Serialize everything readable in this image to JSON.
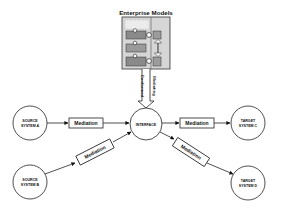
{
  "diagram": {
    "title": "Enterprise Models",
    "interface": {
      "label": "INTERFACE"
    },
    "vertical_link": {
      "left_label": "Conformed",
      "right_label": "Mediating"
    },
    "sources": [
      {
        "line1": "SOURCE",
        "line2": "SYSTEM A"
      },
      {
        "line1": "SOURCE",
        "line2": "SYSTEM B"
      }
    ],
    "targets": [
      {
        "line1": "TARGET",
        "line2": "SYSTEM C"
      },
      {
        "line1": "TARGET",
        "line2": "SYSTEM D"
      }
    ],
    "mediations": [
      {
        "label": "Mediation"
      },
      {
        "label": "Mediation"
      },
      {
        "label": "Mediation"
      },
      {
        "label": "Mediation"
      }
    ],
    "colors": {
      "stroke": "#1a1a1a",
      "model_panel": "#d8d8d8",
      "model_bar": "#8c8c8c",
      "model_bar_light": "#b4b4b4",
      "model_header": "#e6e6e6"
    }
  }
}
